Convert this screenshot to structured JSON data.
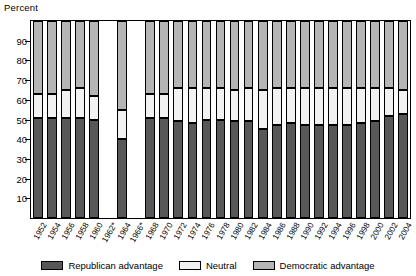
{
  "chart_data": {
    "type": "bar",
    "subtype": "stacked-percent",
    "title": "",
    "ylabel": "Percent",
    "xlabel": "",
    "ylim": [
      0,
      100
    ],
    "yticks": [
      10,
      20,
      30,
      40,
      50,
      60,
      70,
      80,
      90
    ],
    "grid": false,
    "legend_position": "bottom",
    "note": "Years 1962 and 1966 are marked with an asterisk; 1962 and 1966 have no bars (no data).",
    "categories": [
      "1952",
      "1954",
      "1956",
      "1958",
      "1960",
      "1962*",
      "1964",
      "1966*",
      "1968",
      "1970",
      "1972",
      "1974",
      "1976",
      "1978",
      "1980",
      "1982",
      "1984",
      "1986",
      "1988",
      "1990",
      "1992",
      "1994",
      "1996",
      "1998",
      "2000",
      "2002",
      "2004"
    ],
    "series": [
      {
        "name": "Republican advantage",
        "color": "#585858",
        "values": [
          51,
          51,
          51,
          51,
          50,
          null,
          40,
          null,
          51,
          51,
          49,
          48,
          50,
          50,
          49,
          49,
          45,
          47,
          48,
          47,
          47,
          47,
          47,
          48,
          49,
          52,
          53
        ]
      },
      {
        "name": "Neutral",
        "color": "#f2f2f2",
        "values": [
          12,
          12,
          14,
          15,
          12,
          null,
          15,
          null,
          12,
          12,
          17,
          18,
          16,
          16,
          16,
          17,
          20,
          19,
          18,
          19,
          19,
          19,
          19,
          18,
          17,
          14,
          12
        ]
      },
      {
        "name": "Democratic advantage",
        "color": "#b5b5b5",
        "values": [
          37,
          37,
          35,
          34,
          38,
          null,
          45,
          null,
          37,
          37,
          34,
          34,
          34,
          34,
          35,
          34,
          35,
          34,
          34,
          34,
          34,
          34,
          34,
          34,
          34,
          34,
          35
        ]
      }
    ]
  },
  "legend": {
    "items": [
      {
        "label": "Republican advantage",
        "color": "#585858"
      },
      {
        "label": "Neutral",
        "color": "#f2f2f2"
      },
      {
        "label": "Democratic advantage",
        "color": "#b5b5b5"
      }
    ]
  }
}
